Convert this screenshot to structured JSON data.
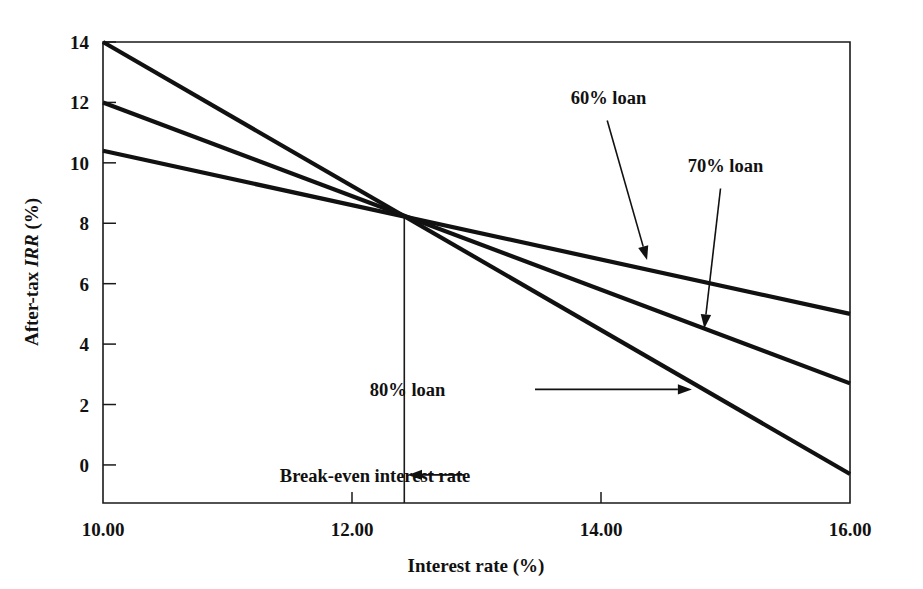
{
  "chart_data": {
    "type": "line",
    "title": "",
    "xlabel": "Interest rate (%)",
    "ylabel_prefix": "After-tax ",
    "ylabel_italic": "IRR",
    "ylabel_suffix": " (%)",
    "xlim": [
      10.0,
      16.0
    ],
    "ylim": [
      -1.26,
      14.0
    ],
    "xticks": [
      10.0,
      12.0,
      14.0,
      16.0
    ],
    "xtick_labels": [
      "10.00",
      "12.00",
      "14.00",
      "16.00"
    ],
    "yticks": [
      0,
      2,
      4,
      6,
      8,
      10,
      12,
      14
    ],
    "ytick_labels": [
      "0",
      "2",
      "4",
      "6",
      "8",
      "10",
      "12",
      "14"
    ],
    "grid": false,
    "legend_position": "annotations-inline",
    "x": [
      10.0,
      16.0
    ],
    "series": [
      {
        "name": "60% loan",
        "values": [
          10.4,
          5.0
        ]
      },
      {
        "name": "70% loan",
        "values": [
          12.0,
          2.7
        ]
      },
      {
        "name": "80% loan",
        "values": [
          14.0,
          -0.3
        ]
      }
    ],
    "intersection": {
      "x": 12.42,
      "y": 8.22
    },
    "annotations": [
      {
        "name": "60% loan",
        "label": "60% loan",
        "label_x": 14.06,
        "label_y": 11.95,
        "arrow_from_x": 14.05,
        "arrow_from_y": 11.4,
        "arrow_to_x": 14.37,
        "arrow_to_y": 6.78
      },
      {
        "name": "70% loan",
        "label": "70% loan",
        "label_x": 15.0,
        "label_y": 9.7,
        "arrow_from_x": 14.96,
        "arrow_from_y": 9.15,
        "arrow_to_x": 14.83,
        "arrow_to_y": 4.52
      },
      {
        "name": "80% loan",
        "label": "80% loan",
        "label_x": 12.75,
        "label_y": 2.5,
        "arrow_from_x": 13.47,
        "arrow_from_y": 2.5,
        "arrow_to_x": 14.73,
        "arrow_to_y": 2.5
      },
      {
        "name": "break-even interest rate",
        "label": "Break-even interest rate",
        "label_x": 12.95,
        "label_y": -0.33,
        "arrow_from_x": 12.9,
        "arrow_from_y": -0.33,
        "arrow_to_x": 12.45,
        "arrow_to_y": -0.33
      }
    ],
    "marker_lines": [
      {
        "name": "break-even-vertical",
        "x": 12.42,
        "y_from": -1.26,
        "y_to": 8.22
      }
    ]
  }
}
